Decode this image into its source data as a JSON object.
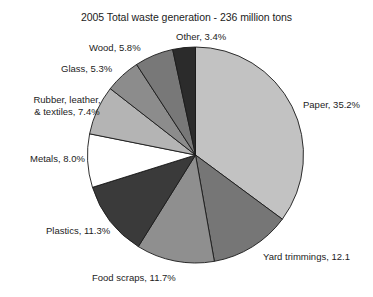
{
  "chart_data": {
    "type": "pie",
    "title": "2005 Total waste generation - 236 million tons",
    "subtitle": "",
    "xlabel": "",
    "ylabel": "",
    "total_label": "236 million tons",
    "total_value": 236,
    "units": "million tons",
    "year": 2005,
    "legend_position": "none",
    "grid": false,
    "labels_on_slices": false,
    "start_angle_deg": 0,
    "direction": "clockwise",
    "categories": [
      "Paper",
      "Yard trimmings",
      "Food scraps",
      "Plastics",
      "Metals",
      "Rubber, leather, & textiles",
      "Glass",
      "Wood",
      "Other"
    ],
    "values": [
      35.2,
      12.1,
      11.7,
      11.3,
      8.0,
      7.4,
      5.3,
      5.8,
      3.4
    ],
    "slices": [
      {
        "name": "Paper",
        "value": 35.2,
        "label": "Paper, 35.2%",
        "color": "#c2c2c2"
      },
      {
        "name": "Yard trimmings",
        "value": 12.1,
        "label": "Yard trimmings, 12.1",
        "color": "#767676"
      },
      {
        "name": "Food scraps",
        "value": 11.7,
        "label": "Food scraps, 11.7%",
        "color": "#8f8f8f"
      },
      {
        "name": "Plastics",
        "value": 11.3,
        "label": "Plastics, 11.3%",
        "color": "#3a3a3a"
      },
      {
        "name": "Metals",
        "value": 8.0,
        "label": "Metals, 8.0%",
        "color": "#ffffff"
      },
      {
        "name": "Rubber, leather, & textiles",
        "value": 7.4,
        "label": "Rubber, leather, & textiles, 7.4%",
        "color": "#b4b4b4"
      },
      {
        "name": "Glass",
        "value": 5.3,
        "label": "Glass, 5.3%",
        "color": "#8c8c8c"
      },
      {
        "name": "Wood",
        "value": 5.8,
        "label": "Wood, 5.8%",
        "color": "#787878"
      },
      {
        "name": "Other",
        "value": 3.4,
        "label": "Other, 3.4%",
        "color": "#2b2b2b"
      }
    ]
  },
  "labels": {
    "paper": "Paper, 35.2%",
    "yard_trimmings": "Yard trimmings, 12.1",
    "food_scraps": "Food scraps, 11.7%",
    "plastics": "Plastics, 11.3%",
    "metals": "Metals, 8.0%",
    "rubber_line1": "Rubber, leather,",
    "rubber_line2": "& textiles, 7.4%",
    "glass": "Glass, 5.3%",
    "wood": "Wood, 5.8%",
    "other": "Other, 3.4%"
  }
}
